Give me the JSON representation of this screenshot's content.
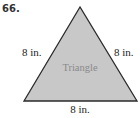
{
  "problem": {
    "number": "66."
  },
  "figure": {
    "shape": "equilateral triangle",
    "inner_label": "Triangle",
    "fill_color": "#c8c8c8",
    "stroke_color": "#2a2a2a",
    "sides": {
      "left": "8 in.",
      "right": "8 in.",
      "bottom": "8 in."
    }
  }
}
